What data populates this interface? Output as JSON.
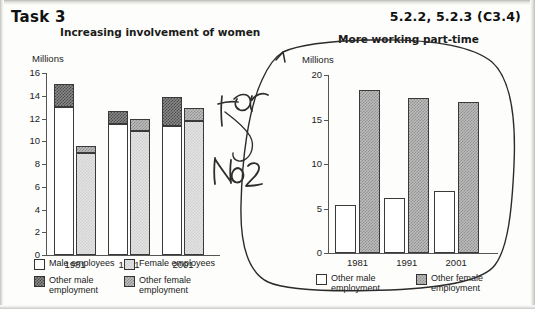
{
  "page": {
    "task_label": "Task 3",
    "code_label": "5.2.2, 5.2.3 (C3.4)"
  },
  "annotation": {
    "handwriting_line1": "For",
    "handwriting_line2": "No 2",
    "shape": "lasso-circle-with-arrow"
  },
  "chart_data": [
    {
      "id": "left",
      "type": "bar",
      "title": "Increasing involvement of women",
      "ylabel": "Millions",
      "xlabel": "",
      "categories": [
        "1981",
        "1991",
        "2001"
      ],
      "ylim": [
        0,
        16
      ],
      "yticks": [
        0,
        2,
        4,
        6,
        8,
        10,
        12,
        14,
        16
      ],
      "grid": false,
      "stacked": true,
      "legend_position": "bottom",
      "series": [
        {
          "name": "Male employees",
          "fill": "white",
          "values": [
            13.0,
            11.5,
            11.3
          ]
        },
        {
          "name": "Other male employment",
          "fill": "dark",
          "values": [
            2.0,
            1.2,
            2.6
          ]
        },
        {
          "name": "Female employees",
          "fill": "light",
          "values": [
            9.0,
            10.9,
            11.8
          ]
        },
        {
          "name": "Other female employment",
          "fill": "mid",
          "values": [
            0.6,
            1.1,
            1.1
          ]
        }
      ],
      "bar_totals": {
        "male": [
          15.0,
          12.7,
          13.9
        ],
        "female": [
          9.6,
          12.0,
          12.9
        ]
      },
      "legend": [
        {
          "label": "Male employees",
          "fill": "white"
        },
        {
          "label": "Female employees",
          "fill": "light"
        },
        {
          "label": "Other male\nemployment",
          "fill": "dark"
        },
        {
          "label": "Other female\nemployment",
          "fill": "mid"
        }
      ]
    },
    {
      "id": "right",
      "type": "bar",
      "title": "More working part-time",
      "ylabel": "Millions",
      "xlabel": "",
      "categories": [
        "1981",
        "1991",
        "2001"
      ],
      "ylim": [
        0,
        20
      ],
      "yticks": [
        0,
        5,
        10,
        15,
        20
      ],
      "grid": false,
      "stacked": false,
      "legend_position": "bottom",
      "series": [
        {
          "name": "Other male employment",
          "fill": "white",
          "values": [
            5.4,
            6.2,
            7.0
          ]
        },
        {
          "name": "Other female employment",
          "fill": "mid",
          "values": [
            18.3,
            17.4,
            17.0
          ]
        }
      ],
      "legend": [
        {
          "label": "Other male\nemployment",
          "fill": "white"
        },
        {
          "label": "Other female\nemployment",
          "fill": "mid"
        }
      ]
    }
  ]
}
